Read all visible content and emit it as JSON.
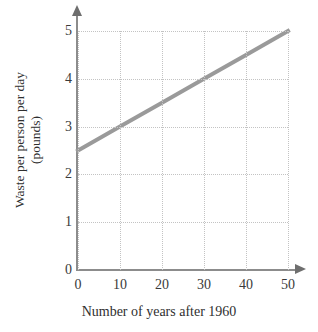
{
  "chart_data": {
    "type": "line",
    "title": "",
    "xlabel": "Number of years after 1960",
    "ylabel": "Waste per person per day (pounds)",
    "ylabel_line1": "Waste per person per day",
    "ylabel_line2": "(pounds)",
    "xlim": [
      0,
      50
    ],
    "ylim": [
      0,
      5
    ],
    "xticks": [
      0,
      10,
      20,
      30,
      40,
      50
    ],
    "xtick_labels": [
      "0",
      "10",
      "20",
      "30",
      "40",
      "50"
    ],
    "yticks": [
      0,
      1,
      2,
      3,
      4,
      5
    ],
    "ytick_labels": [
      "0",
      "1",
      "2",
      "3",
      "4",
      "5"
    ],
    "grid": true,
    "legend": false,
    "series": [
      {
        "name": "Waste per person per day",
        "x": [
          0,
          10,
          20,
          30,
          40,
          50
        ],
        "values": [
          2.5,
          3.0,
          3.5,
          4.0,
          4.5,
          5.0
        ],
        "color": "#9a9a9a",
        "line_width": 4,
        "slope": 0.05,
        "intercept": 2.5
      }
    ],
    "axis_color": "#8c8c8c",
    "grid_color": "#c3c3c3",
    "background": "#ffffff"
  }
}
